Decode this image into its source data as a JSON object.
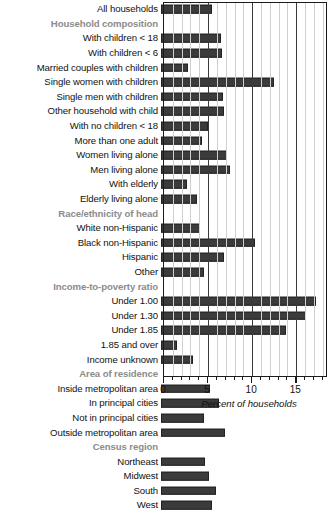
{
  "chart_data": {
    "type": "bar",
    "orientation": "horizontal",
    "title": "",
    "xlabel": "Percent of households",
    "ylabel": "",
    "xlim": [
      0,
      18.6
    ],
    "xticks": [
      0,
      5,
      10,
      15
    ],
    "xtick_labels": [
      "0",
      "5",
      "10",
      "15"
    ],
    "minor_tick_step": 1,
    "grid": "vertical",
    "legend": "none",
    "bar_color": "#3b3b3b",
    "header_color": "#8c8c8c",
    "rows": [
      {
        "label": "All households",
        "type": "data",
        "value": 5.8
      },
      {
        "label": "Household composition",
        "type": "header",
        "value": null
      },
      {
        "label": "With children < 18",
        "type": "data",
        "value": 6.8
      },
      {
        "label": "With children < 6",
        "type": "data",
        "value": 6.9
      },
      {
        "label": "Married couples with children",
        "type": "data",
        "value": 3.1
      },
      {
        "label": "Single women with children",
        "type": "data",
        "value": 12.8
      },
      {
        "label": "Single men with children",
        "type": "data",
        "value": 7.0
      },
      {
        "label": "Other household with child",
        "type": "data",
        "value": 7.1
      },
      {
        "label": "With no children < 18",
        "type": "data",
        "value": 5.3
      },
      {
        "label": "More than one adult",
        "type": "data",
        "value": 4.6
      },
      {
        "label": "Women living alone",
        "type": "data",
        "value": 7.5
      },
      {
        "label": "Men living alone",
        "type": "data",
        "value": 7.8
      },
      {
        "label": "With elderly",
        "type": "data",
        "value": 2.9
      },
      {
        "label": "Elderly living alone",
        "type": "data",
        "value": 4.1
      },
      {
        "label": "Race/ethnicity of head",
        "type": "header",
        "value": null
      },
      {
        "label": "White non-Hispanic",
        "type": "data",
        "value": 4.4
      },
      {
        "label": "Black non-Hispanic",
        "type": "data",
        "value": 10.7
      },
      {
        "label": "Hispanic",
        "type": "data",
        "value": 7.1
      },
      {
        "label": "Other",
        "type": "data",
        "value": 4.9
      },
      {
        "label": "Income-to-poverty ratio",
        "type": "header",
        "value": null
      },
      {
        "label": "Under 1.00",
        "type": "data",
        "value": 17.6
      },
      {
        "label": "Under 1.30",
        "type": "data",
        "value": 16.4
      },
      {
        "label": "Under 1.85",
        "type": "data",
        "value": 14.2
      },
      {
        "label": "1.85 and over",
        "type": "data",
        "value": 1.8
      },
      {
        "label": "Income unknown",
        "type": "data",
        "value": 3.6
      },
      {
        "label": "Area of residence",
        "type": "header",
        "value": null
      },
      {
        "label": "Inside metropolitan area",
        "type": "data",
        "value": 5.6
      },
      {
        "label": "In principal cities",
        "type": "data",
        "value": 6.6
      },
      {
        "label": "Not in principal cities",
        "type": "data",
        "value": 4.9
      },
      {
        "label": "Outside metropolitan area",
        "type": "data",
        "value": 7.3
      },
      {
        "label": "Census region",
        "type": "header",
        "value": null
      },
      {
        "label": "Northeast",
        "type": "data",
        "value": 5.0
      },
      {
        "label": "Midwest",
        "type": "data",
        "value": 5.5
      },
      {
        "label": "South",
        "type": "data",
        "value": 6.2
      },
      {
        "label": "West",
        "type": "data",
        "value": 5.8
      }
    ]
  }
}
